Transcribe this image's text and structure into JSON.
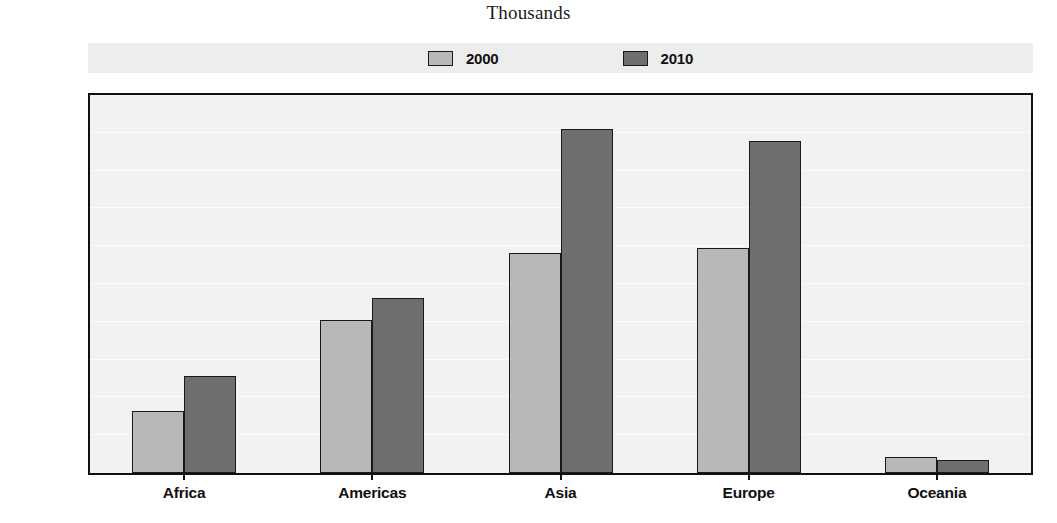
{
  "chart_data": {
    "type": "bar",
    "title": "Thousands",
    "xlabel": "",
    "ylabel": "",
    "ylim": [
      0,
      2000
    ],
    "ytick_values": [
      0,
      200,
      400,
      600,
      800,
      1000,
      1200,
      1400,
      1600,
      1800,
      2000
    ],
    "ytick_labels": [
      "0",
      "200",
      "400",
      "600",
      "800",
      "1 000",
      "1 200",
      "1 400",
      "1 600",
      "1 800",
      "2 000"
    ],
    "grid": true,
    "legend_position": "top-center",
    "categories": [
      "Africa",
      "Americas",
      "Asia",
      "Europe",
      "Oceania"
    ],
    "series": [
      {
        "name": "2000",
        "color": "#b8b8b8",
        "values": [
          330,
          810,
          1165,
          1190,
          85
        ]
      },
      {
        "name": "2010",
        "color": "#6e6e6e",
        "values": [
          515,
          925,
          1820,
          1755,
          70
        ]
      }
    ]
  },
  "legend": {
    "items": [
      {
        "label": "2000",
        "color": "#b8b8b8"
      },
      {
        "label": "2010",
        "color": "#6e6e6e"
      }
    ]
  },
  "colors": {
    "series_2000": "#b8b8b8",
    "series_2010": "#6e6e6e",
    "plot_background": "#f2f2f2",
    "legend_background": "#ededed",
    "axis": "#111111",
    "text": "#111111"
  }
}
